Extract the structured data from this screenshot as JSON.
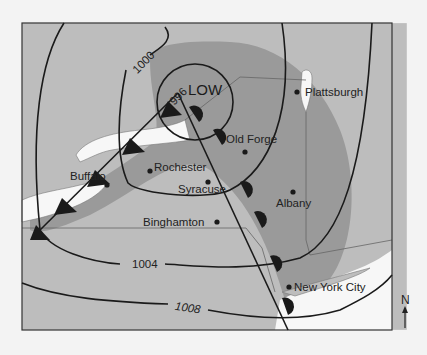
{
  "map": {
    "type": "weather map",
    "pressure_center": {
      "label": "LOW"
    },
    "isobars": [
      {
        "value": "996"
      },
      {
        "value": "1000"
      },
      {
        "value": "1004"
      },
      {
        "value": "1008"
      }
    ],
    "cities": [
      {
        "name": "Plattsburgh"
      },
      {
        "name": "Old Forge"
      },
      {
        "name": "Rochester"
      },
      {
        "name": "Buffalo"
      },
      {
        "name": "Syracuse"
      },
      {
        "name": "Albany"
      },
      {
        "name": "Binghamton"
      },
      {
        "name": "New York City"
      }
    ],
    "compass": {
      "label": "N"
    },
    "fronts": [
      "cold front",
      "warm front"
    ],
    "colors": {
      "background": "#f3f3f3",
      "land": "#bdbdbd",
      "precip": "#9a9a9a",
      "water": "#f7f7f7",
      "line": "#1a1a1a"
    }
  }
}
